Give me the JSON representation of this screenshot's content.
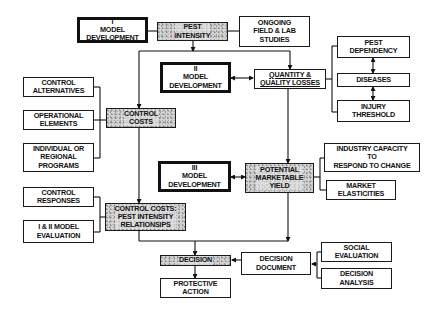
{
  "diagram": {
    "nodes": {
      "model_dev_1": "I\nMODEL\nDEVELOPMENT",
      "pest_intensity": "PEST\nINTENSITY",
      "ongoing_studies": "ONGOING\nFIELD & LAB\nSTUDIES",
      "pest_dependency": "PEST\nDEPENDENCY",
      "model_dev_2": "II\nMODEL\nDEVELOPMENT",
      "quantity_quality_losses": "QUANTITY &\nQUALITY LOSSES",
      "diseases": "DISEASES",
      "injury_threshold": "INJURY\nTHRESHOLD",
      "control_alternatives": "CONTROL\nALTERNATIVES",
      "operational_elements": "OPERATIONAL\nELEMENTS",
      "control_costs": "CONTROL\nCOSTS",
      "individual_regional_programs": "INDIVIDUAL OR\nREGIONAL\nPROGRAMS",
      "industry_capacity": "INDUSTRY CAPACITY\nTO\nRESPOND TO CHANGE",
      "model_dev_3": "III\nMODEL\nDEVELOPMENT",
      "potential_marketable_yield": "POTENTIAL\nMARKETABLE\nYIELD",
      "market_elasticities": "MARKET\nELASTICITIES",
      "control_responses": "CONTROL\nRESPONSES",
      "control_costs_pest_intensity": "CONTROL COSTS:\nPEST INTENSITY\nRELATIONSIPS",
      "model_evaluation": "I & II MODEL\nEVALUATION",
      "decision": "DECISION",
      "decision_document": "DECISION\nDOCUMENT",
      "social_evaluation": "SOCIAL\nEVALUATION",
      "decision_analysis": "DECISION\nANALYSIS",
      "protective_action": "PROTECTIVE\nACTION"
    },
    "edges": [
      {
        "from": "model_dev_1",
        "to": "pest_intensity",
        "type": "line"
      },
      {
        "from": "ongoing_studies",
        "to": "pest_intensity",
        "type": "line"
      },
      {
        "from": "pest_intensity",
        "to": "control_costs",
        "type": "arrow"
      },
      {
        "from": "pest_intensity",
        "to": "quantity_quality_losses",
        "type": "arrow"
      },
      {
        "from": "model_dev_2",
        "to": "quantity_quality_losses",
        "type": "double-arrow"
      },
      {
        "from": "pest_dependency",
        "to": "quantity_quality_losses",
        "type": "line"
      },
      {
        "from": "diseases",
        "to": "quantity_quality_losses",
        "type": "line"
      },
      {
        "from": "injury_threshold",
        "to": "quantity_quality_losses",
        "type": "line"
      },
      {
        "from": "pest_dependency",
        "to": "diseases",
        "type": "double-arrow"
      },
      {
        "from": "diseases",
        "to": "injury_threshold",
        "type": "double-arrow"
      },
      {
        "from": "control_alternatives",
        "to": "control_costs",
        "type": "line"
      },
      {
        "from": "operational_elements",
        "to": "control_costs",
        "type": "line"
      },
      {
        "from": "individual_regional_programs",
        "to": "control_costs",
        "type": "line"
      },
      {
        "from": "control_costs",
        "to": "control_costs_pest_intensity",
        "type": "arrow"
      },
      {
        "from": "quantity_quality_losses",
        "to": "potential_marketable_yield",
        "type": "arrow"
      },
      {
        "from": "model_dev_3",
        "to": "potential_marketable_yield",
        "type": "double-arrow"
      },
      {
        "from": "industry_capacity",
        "to": "potential_marketable_yield",
        "type": "line"
      },
      {
        "from": "market_elasticities",
        "to": "potential_marketable_yield",
        "type": "line"
      },
      {
        "from": "control_responses",
        "to": "control_costs_pest_intensity",
        "type": "line"
      },
      {
        "from": "model_evaluation",
        "to": "control_costs_pest_intensity",
        "type": "line"
      },
      {
        "from": "control_costs_pest_intensity",
        "to": "decision",
        "type": "arrow"
      },
      {
        "from": "potential_marketable_yield",
        "to": "decision",
        "type": "arrow"
      },
      {
        "from": "decision_document",
        "to": "decision",
        "type": "arrow"
      },
      {
        "from": "social_evaluation",
        "to": "decision_document",
        "type": "arrow"
      },
      {
        "from": "decision_analysis",
        "to": "decision_document",
        "type": "arrow"
      },
      {
        "from": "decision",
        "to": "protective_action",
        "type": "arrow"
      }
    ]
  }
}
